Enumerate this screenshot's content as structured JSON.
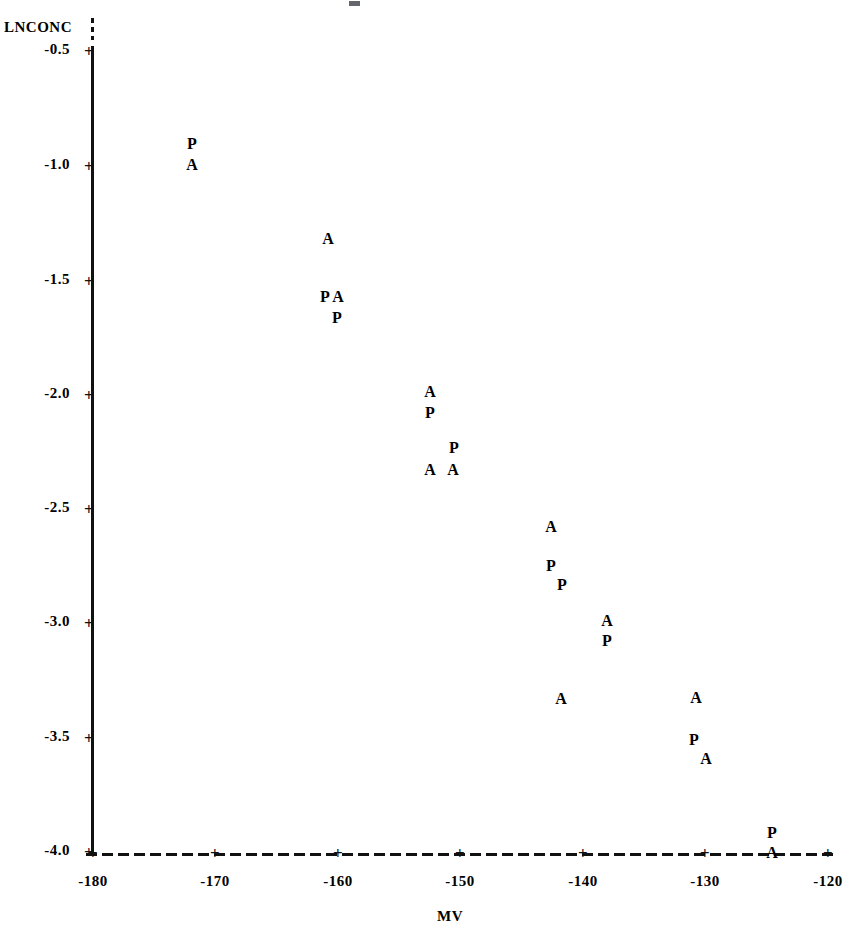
{
  "figure": {
    "y_axis_label": "LNCONC",
    "x_axis_label": "MV"
  },
  "axes": {
    "y_ticks": [
      "-0.5",
      "-1.0",
      "-1.5",
      "-2.0",
      "-2.5",
      "-3.0",
      "-3.5",
      "-4.0"
    ],
    "x_ticks": [
      "-180",
      "-170",
      "-160",
      "-150",
      "-140",
      "-130",
      "-120"
    ],
    "tick_marker": "+"
  },
  "chart_data": {
    "type": "scatter",
    "title": "",
    "xlabel": "MV",
    "ylabel": "LNCONC",
    "xlim": [
      -180,
      -120
    ],
    "ylim": [
      -4.0,
      -0.5
    ],
    "grid": false,
    "legend": "none",
    "marker_style": "character-symbol",
    "series": [
      {
        "name": "A",
        "symbol": "A",
        "points": [
          {
            "x": -171.9,
            "y": -1.0
          },
          {
            "x": -160.8,
            "y": -1.33
          },
          {
            "x": -160.0,
            "y": -1.58
          },
          {
            "x": -152.6,
            "y": -1.99
          },
          {
            "x": -152.6,
            "y": -2.33
          },
          {
            "x": -150.7,
            "y": -2.33
          },
          {
            "x": -142.6,
            "y": -2.58
          },
          {
            "x": -138.0,
            "y": -2.99
          },
          {
            "x": -141.8,
            "y": -3.33
          },
          {
            "x": -130.7,
            "y": -3.33
          },
          {
            "x": -129.9,
            "y": -3.6
          },
          {
            "x": -124.6,
            "y": -4.0
          }
        ]
      },
      {
        "name": "P",
        "symbol": "P",
        "points": [
          {
            "x": -171.9,
            "y": -0.91
          },
          {
            "x": -161.1,
            "y": -1.58
          },
          {
            "x": -160.1,
            "y": -1.67
          },
          {
            "x": -152.6,
            "y": -1.9
          },
          {
            "x": -150.6,
            "y": -2.24
          },
          {
            "x": -142.8,
            "y": -2.75
          },
          {
            "x": -141.9,
            "y": -2.83
          },
          {
            "x": -138.0,
            "y": -2.91
          },
          {
            "x": -130.9,
            "y": -3.51
          },
          {
            "x": -124.6,
            "y": -3.91
          }
        ]
      }
    ]
  },
  "rendered_markers": [
    {
      "symbol": "P",
      "left": 186,
      "top": 136
    },
    {
      "symbol": "A",
      "left": 186,
      "top": 157
    },
    {
      "symbol": "A",
      "left": 322,
      "top": 231
    },
    {
      "symbol": "P",
      "left": 319,
      "top": 289
    },
    {
      "symbol": "A",
      "left": 332,
      "top": 289
    },
    {
      "symbol": "P",
      "left": 331,
      "top": 310
    },
    {
      "symbol": "A",
      "left": 424,
      "top": 384
    },
    {
      "symbol": "P",
      "left": 424,
      "top": 405
    },
    {
      "symbol": "P",
      "left": 448,
      "top": 440
    },
    {
      "symbol": "A",
      "left": 424,
      "top": 462
    },
    {
      "symbol": "A",
      "left": 447,
      "top": 462
    },
    {
      "symbol": "A",
      "left": 545,
      "top": 519
    },
    {
      "symbol": "P",
      "left": 545,
      "top": 558
    },
    {
      "symbol": "P",
      "left": 556,
      "top": 577
    },
    {
      "symbol": "A",
      "left": 601,
      "top": 613
    },
    {
      "symbol": "P",
      "left": 601,
      "top": 633
    },
    {
      "symbol": "A",
      "left": 555,
      "top": 691
    },
    {
      "symbol": "A",
      "left": 690,
      "top": 690
    },
    {
      "symbol": "P",
      "left": 688,
      "top": 732
    },
    {
      "symbol": "A",
      "left": 700,
      "top": 751
    },
    {
      "symbol": "P",
      "left": 766,
      "top": 825
    },
    {
      "symbol": "A",
      "left": 766,
      "top": 845
    }
  ],
  "rendered_y_ticks": [
    {
      "label": "-0.5",
      "top": 42
    },
    {
      "label": "-1.0",
      "top": 157
    },
    {
      "label": "-1.5",
      "top": 272
    },
    {
      "label": "-2.0",
      "top": 386
    },
    {
      "label": "-2.5",
      "top": 500
    },
    {
      "label": "-3.0",
      "top": 614
    },
    {
      "label": "-3.5",
      "top": 729
    },
    {
      "label": "-4.0",
      "top": 843
    }
  ],
  "rendered_x_ticks": [
    {
      "label": "-180",
      "left": 63
    },
    {
      "label": "-170",
      "left": 185
    },
    {
      "label": "-160",
      "left": 308
    },
    {
      "label": "-150",
      "left": 430
    },
    {
      "label": "-140",
      "left": 553
    },
    {
      "label": "-130",
      "left": 675
    },
    {
      "label": "-120",
      "left": 798
    }
  ]
}
